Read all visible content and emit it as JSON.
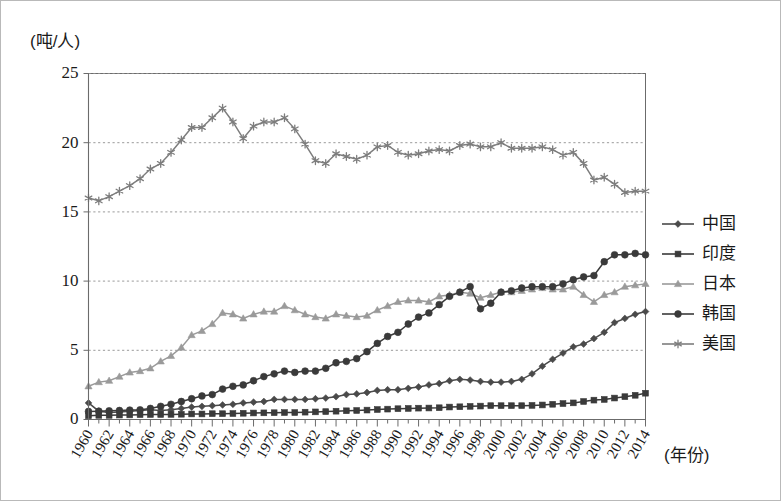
{
  "chart_data": {
    "type": "line",
    "title": "",
    "subtitle": "",
    "ylabel": "(吨/人)",
    "xlabel": "(年份)",
    "ylim": [
      0,
      25
    ],
    "yticks": [
      0,
      5,
      10,
      15,
      20,
      25
    ],
    "ytick_labels": [
      "0",
      "5",
      "10",
      "15",
      "20",
      "25"
    ],
    "xlim": [
      1960,
      2014
    ],
    "grid": "horizontal-dotted",
    "legend_position": "right",
    "x": [
      1960,
      1961,
      1962,
      1963,
      1964,
      1965,
      1966,
      1967,
      1968,
      1969,
      1970,
      1971,
      1972,
      1973,
      1974,
      1975,
      1976,
      1977,
      1978,
      1979,
      1980,
      1981,
      1982,
      1983,
      1984,
      1985,
      1986,
      1987,
      1988,
      1989,
      1990,
      1991,
      1992,
      1993,
      1994,
      1995,
      1996,
      1997,
      1998,
      1999,
      2000,
      2001,
      2002,
      2003,
      2004,
      2005,
      2006,
      2007,
      2008,
      2009,
      2010,
      2011,
      2012,
      2013,
      2014
    ],
    "xtick_labels": [
      "1960",
      "1962",
      "1964",
      "1966",
      "1968",
      "1970",
      "1972",
      "1974",
      "1976",
      "1978",
      "1980",
      "1982",
      "1984",
      "1986",
      "1988",
      "1990",
      "1992",
      "1994",
      "1996",
      "1998",
      "2000",
      "2002",
      "2004",
      "2006",
      "2008",
      "2010",
      "2012",
      "2014"
    ],
    "series": [
      {
        "name": "中国",
        "marker": "diamond",
        "color": "#4a4a4a",
        "values": [
          1.2,
          0.6,
          0.5,
          0.55,
          0.6,
          0.65,
          0.7,
          0.65,
          0.7,
          0.8,
          0.9,
          0.95,
          1.0,
          1.05,
          1.1,
          1.2,
          1.25,
          1.3,
          1.45,
          1.45,
          1.45,
          1.45,
          1.5,
          1.55,
          1.65,
          1.8,
          1.85,
          1.95,
          2.1,
          2.15,
          2.15,
          2.25,
          2.35,
          2.5,
          2.6,
          2.8,
          2.9,
          2.85,
          2.75,
          2.7,
          2.7,
          2.75,
          2.9,
          3.3,
          3.85,
          4.35,
          4.8,
          5.25,
          5.45,
          5.85,
          6.3,
          7.0,
          7.3,
          7.6,
          7.8
        ]
      },
      {
        "name": "印度",
        "marker": "square",
        "color": "#3a3a3a",
        "values": [
          0.27,
          0.3,
          0.3,
          0.32,
          0.33,
          0.35,
          0.36,
          0.36,
          0.37,
          0.38,
          0.4,
          0.4,
          0.42,
          0.42,
          0.43,
          0.45,
          0.47,
          0.48,
          0.49,
          0.5,
          0.5,
          0.53,
          0.55,
          0.57,
          0.6,
          0.63,
          0.65,
          0.68,
          0.72,
          0.75,
          0.78,
          0.8,
          0.82,
          0.83,
          0.85,
          0.9,
          0.92,
          0.95,
          0.97,
          1.0,
          1.0,
          1.0,
          1.0,
          1.02,
          1.05,
          1.1,
          1.15,
          1.2,
          1.3,
          1.4,
          1.45,
          1.55,
          1.65,
          1.75,
          1.9
        ]
      },
      {
        "name": "日本",
        "marker": "triangle",
        "color": "#9a9a9a",
        "values": [
          2.4,
          2.7,
          2.8,
          3.1,
          3.4,
          3.5,
          3.7,
          4.2,
          4.6,
          5.2,
          6.1,
          6.4,
          6.9,
          7.7,
          7.6,
          7.3,
          7.6,
          7.8,
          7.8,
          8.2,
          7.9,
          7.6,
          7.4,
          7.3,
          7.6,
          7.5,
          7.4,
          7.5,
          7.9,
          8.2,
          8.5,
          8.6,
          8.6,
          8.5,
          8.9,
          9.0,
          9.2,
          9.1,
          8.8,
          9.0,
          9.2,
          9.2,
          9.3,
          9.4,
          9.5,
          9.4,
          9.4,
          9.6,
          9.0,
          8.5,
          9.0,
          9.2,
          9.6,
          9.7,
          9.8
        ]
      },
      {
        "name": "韩国",
        "marker": "circle",
        "color": "#3a3a3a",
        "values": [
          0.58,
          0.6,
          0.63,
          0.65,
          0.68,
          0.7,
          0.8,
          0.95,
          1.1,
          1.3,
          1.5,
          1.7,
          1.8,
          2.2,
          2.4,
          2.5,
          2.8,
          3.1,
          3.3,
          3.5,
          3.4,
          3.5,
          3.5,
          3.7,
          4.1,
          4.2,
          4.4,
          4.9,
          5.5,
          6.0,
          6.3,
          6.9,
          7.4,
          7.7,
          8.3,
          8.9,
          9.2,
          9.6,
          8.0,
          8.4,
          9.2,
          9.3,
          9.5,
          9.6,
          9.6,
          9.6,
          9.8,
          10.1,
          10.3,
          10.4,
          11.4,
          11.9,
          11.9,
          12.0,
          11.9
        ]
      },
      {
        "name": "美国",
        "marker": "asterisk",
        "color": "#7d7d7d",
        "values": [
          16.0,
          15.8,
          16.1,
          16.5,
          16.9,
          17.4,
          18.1,
          18.5,
          19.3,
          20.2,
          21.1,
          21.1,
          21.8,
          22.5,
          21.5,
          20.3,
          21.2,
          21.5,
          21.5,
          21.8,
          21.0,
          19.9,
          18.7,
          18.5,
          19.2,
          19.0,
          18.8,
          19.1,
          19.7,
          19.8,
          19.3,
          19.1,
          19.2,
          19.4,
          19.5,
          19.4,
          19.8,
          19.9,
          19.7,
          19.7,
          20.0,
          19.6,
          19.6,
          19.6,
          19.7,
          19.5,
          19.1,
          19.3,
          18.5,
          17.3,
          17.5,
          17.0,
          16.4,
          16.5,
          16.5
        ]
      }
    ]
  },
  "legend": {
    "items": [
      {
        "label": "中国",
        "marker": "diamond-icon",
        "color": "#4a4a4a"
      },
      {
        "label": "印度",
        "marker": "square-icon",
        "color": "#3a3a3a"
      },
      {
        "label": "日本",
        "marker": "triangle-icon",
        "color": "#9a9a9a"
      },
      {
        "label": "韩国",
        "marker": "circle-icon",
        "color": "#3a3a3a"
      },
      {
        "label": "美国",
        "marker": "asterisk-icon",
        "color": "#7d7d7d"
      }
    ]
  },
  "axes": {
    "y_axis_title": "(吨/人)",
    "x_axis_title": "(年份)"
  }
}
